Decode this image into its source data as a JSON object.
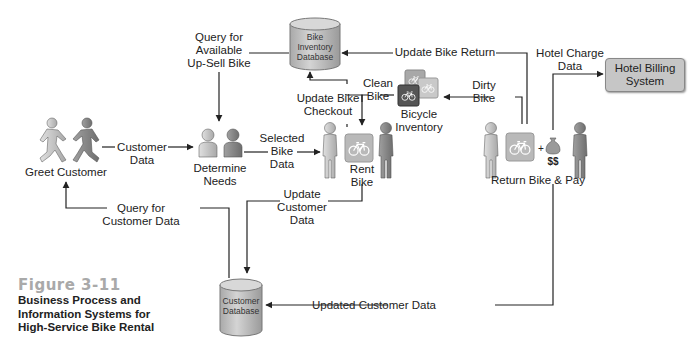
{
  "figure": {
    "title": "Figure 3-11",
    "caption": "Business Process and\nInformation Systems for\nHigh-Service Bike Rental"
  },
  "nodes": {
    "greet_customer": "Greet Customer",
    "determine_needs": "Determine\nNeeds",
    "rent_bike": "Rent\nBike",
    "return_bike_pay": "Return Bike & Pay",
    "bicycle_inventory": "Bicycle\nInventory",
    "bike_inventory_db": "Bike\nInventory\nDatabase",
    "customer_db": "Customer\nDatabase",
    "hotel_billing": "Hotel Billing\nSystem",
    "money": "$$",
    "plus": "+"
  },
  "flows": {
    "customer_data": "Customer\nData",
    "query_upsell": "Query for\nAvailable\nUp-Sell Bike",
    "selected_bike_data": "Selected\nBike\nData",
    "update_bike_checkout": "Update Bike\nCheckout",
    "clean_bike": "Clean\nBike",
    "dirty_bike": "Dirty\nBike",
    "update_bike_return": "Update Bike Return",
    "hotel_charge_data": "Hotel Charge\nData",
    "update_customer_data": "Update\nCustomer\nData",
    "query_customer_data": "Query for\nCustomer Data",
    "updated_customer_data": "Updated Customer Data"
  },
  "colors": {
    "line": "#222222",
    "person_light": "#c8c8c8",
    "person_dark": "#8a8a8a",
    "db_fill": "#c4c4c4",
    "bike_tile": "#b8b8b8",
    "bike_tile_dark": "#555555",
    "caption_title": "#a9a9a9"
  }
}
